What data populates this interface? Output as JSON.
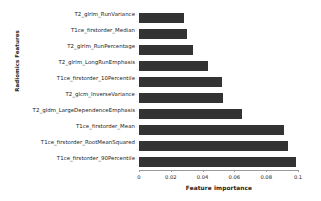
{
  "chart_data": {
    "type": "bar",
    "orientation": "horizontal",
    "title": "",
    "xlabel": "Feature importance",
    "ylabel": "Radiomics Features",
    "categories": [
      "T2_glrlm_RunVariance",
      "T1ce_firstorder_Median",
      "T2_glrlm_RunPercentage",
      "T2_glrlm_LongRunEmphasis",
      "T1ce_firstorder_10Percentile",
      "T2_glcm_InverseVariance",
      "T2_gldm_LargeDependenceEmphasis",
      "T1ce_firstorder_Mean",
      "T1ce_firstorder_RootMeanSquared",
      "T1ce_firstorder_90Percentile"
    ],
    "values": [
      0.028,
      0.03,
      0.034,
      0.0435,
      0.0525,
      0.053,
      0.065,
      0.0915,
      0.094,
      0.099
    ],
    "xlim": [
      0,
      0.1
    ],
    "xticks": [
      0,
      0.02,
      0.04,
      0.06,
      0.08,
      0.1
    ],
    "xticklabels": [
      "0",
      "0.02",
      "0.04",
      "0.06",
      "0.08",
      "0.1"
    ],
    "grid": false,
    "legend": null,
    "bar_color": "#333333",
    "axis_color": "#9a9a9a",
    "background": "#ffffff"
  }
}
